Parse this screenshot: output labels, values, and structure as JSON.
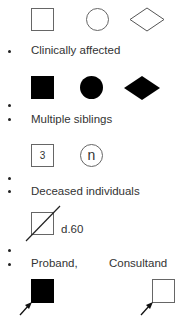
{
  "legend": {
    "rows": [
      {
        "id": "unaffected",
        "label": "",
        "symbols": [
          "male-square-open",
          "female-circle-open",
          "unknown-sex-diamond-open"
        ]
      },
      {
        "id": "affected",
        "label": "Clinically affected",
        "symbols": [
          "male-square-filled",
          "female-circle-filled",
          "unknown-sex-diamond-filled"
        ]
      },
      {
        "id": "multiple",
        "label": "Multiple siblings",
        "symbols": [
          {
            "shape": "square",
            "text": "3"
          },
          {
            "shape": "circle",
            "text": "n"
          }
        ]
      },
      {
        "id": "deceased",
        "label": "Deceased individuals",
        "symbols": [
          {
            "shape": "square-slash",
            "annotation": "d.60"
          }
        ]
      },
      {
        "id": "proband-consultand",
        "label": "Proband,",
        "label2": "Consultand",
        "symbols": [
          "proband-filled-square-arrow",
          "consultand-open-square-arrow"
        ]
      }
    ]
  },
  "labels": {
    "clinically_affected": "Clinically affected",
    "multiple_siblings": "Multiple siblings",
    "deceased_individuals": "Deceased individuals",
    "proband": "Proband,",
    "consultand": "Consultand"
  },
  "symbols": {
    "multiple_count_square": "3",
    "multiple_count_circle": "n",
    "deceased_age": "d.60"
  },
  "colors": {
    "outline": "#666666",
    "fill": "#000000",
    "text": "#333333",
    "background": "#ffffff"
  }
}
